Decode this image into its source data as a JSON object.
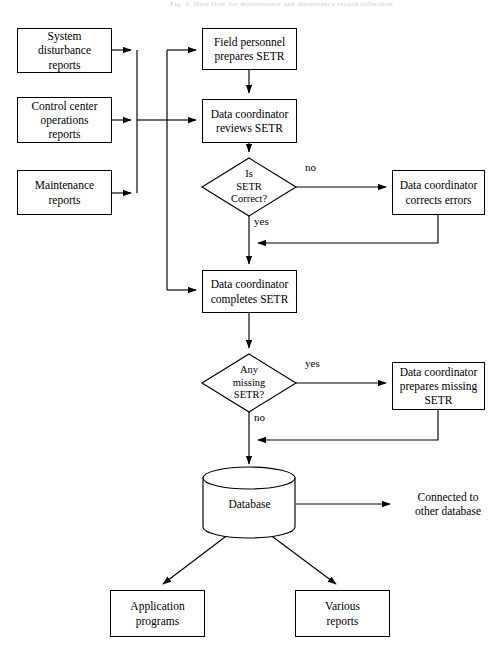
{
  "page": {
    "header_faint": "Fig. 4. Data flow for maintenance and disturbance record collection",
    "ink_color": "#000000",
    "background": "#ffffff"
  },
  "diagram": {
    "type": "flowchart",
    "inputs": [
      {
        "id": "system-disturbance-reports",
        "label": "System\ndisturbance\nreports",
        "lines": [
          "System",
          "disturbance",
          "reports"
        ],
        "shape": "rect",
        "x": 17,
        "y": 28,
        "w": 95,
        "h": 45
      },
      {
        "id": "control-center-operations-reports",
        "label": "Control center\noperations\nreports",
        "lines": [
          "Control center",
          "operations",
          "reports"
        ],
        "shape": "rect",
        "x": 17,
        "y": 97,
        "w": 95,
        "h": 46
      },
      {
        "id": "maintenance-reports",
        "label": "Maintenance\nreports",
        "lines": [
          "Maintenance",
          "reports"
        ],
        "shape": "rect",
        "x": 17,
        "y": 170,
        "w": 95,
        "h": 45
      }
    ],
    "process": [
      {
        "id": "field-personnel-prepares-setr",
        "label": "Field personnel\nprepares SETR",
        "lines": [
          "Field personnel",
          "prepares SETR"
        ],
        "shape": "rect",
        "x": 202,
        "y": 28,
        "w": 95,
        "h": 42
      },
      {
        "id": "data-coordinator-reviews-setr",
        "label": "Data coordinator\nreviews SETR",
        "lines": [
          "Data coordinator",
          "reviews SETR"
        ],
        "shape": "rect",
        "x": 202,
        "y": 99,
        "w": 95,
        "h": 44
      },
      {
        "id": "data-coordinator-completes-setr",
        "label": "Data coordinator\ncompletes SETR",
        "lines": [
          "Data coordinator",
          "completes SETR"
        ],
        "shape": "rect",
        "x": 202,
        "y": 270,
        "w": 95,
        "h": 43
      },
      {
        "id": "data-coordinator-corrects-errors",
        "label": "Data coordinator\ncorrects errors",
        "lines": [
          "Data coordinator",
          "corrects errors"
        ],
        "shape": "rect",
        "x": 392,
        "y": 170,
        "w": 93,
        "h": 45
      },
      {
        "id": "data-coordinator-prepares-missing-setr",
        "label": "Data coordinator\nprepares missing\nSETR",
        "lines": [
          "Data coordinator",
          "prepares missing",
          "SETR"
        ],
        "shape": "rect",
        "x": 392,
        "y": 362,
        "w": 93,
        "h": 48
      }
    ],
    "decisions": [
      {
        "id": "is-setr-correct",
        "lines": [
          "Is",
          "SETR",
          "Correct?"
        ],
        "shape": "diamond",
        "cx": 249,
        "cy": 187,
        "rx": 47,
        "ry": 29,
        "branches": [
          {
            "label": "no",
            "direction": "right",
            "target": "data-coordinator-corrects-errors",
            "lx": 305,
            "ly": 167
          },
          {
            "label": "yes",
            "direction": "down",
            "target": "data-coordinator-completes-setr",
            "lx": 254,
            "ly": 219
          }
        ]
      },
      {
        "id": "any-missing-setr",
        "lines": [
          "Any",
          "missing",
          "SETR?"
        ],
        "shape": "diamond",
        "cx": 249,
        "cy": 383,
        "rx": 47,
        "ry": 29,
        "branches": [
          {
            "label": "yes",
            "direction": "right",
            "target": "data-coordinator-prepares-missing-setr",
            "lx": 305,
            "ly": 363
          },
          {
            "label": "no",
            "direction": "down",
            "target": "database",
            "lx": 254,
            "ly": 415
          }
        ]
      }
    ],
    "store": {
      "id": "database",
      "label": "Database",
      "shape": "cylinder",
      "x": 203,
      "y": 468,
      "w": 93,
      "h": 68,
      "cx": 249,
      "cy": 504
    },
    "outputs": [
      {
        "id": "connected-to-other-database",
        "label": "Connected to\nother database",
        "lines": [
          "Connected to",
          "other database"
        ],
        "shape": "text",
        "x": 400,
        "y": 487,
        "w": 96,
        "h": 34
      },
      {
        "id": "application-programs",
        "label": "Application\nprograms",
        "lines": [
          "Application",
          "programs"
        ],
        "shape": "rect",
        "x": 110,
        "y": 590,
        "w": 95,
        "h": 47
      },
      {
        "id": "various-reports",
        "label": "Various\nreports",
        "lines": [
          "Various",
          "reports"
        ],
        "shape": "rect",
        "x": 295,
        "y": 590,
        "w": 95,
        "h": 47
      }
    ],
    "edges": [
      {
        "from": "system-disturbance-reports",
        "to": "input-bus",
        "label": ""
      },
      {
        "from": "control-center-operations-reports",
        "to": "input-bus",
        "label": ""
      },
      {
        "from": "maintenance-reports",
        "to": "input-bus",
        "label": ""
      },
      {
        "from": "input-bus",
        "to": "field-personnel-prepares-setr",
        "label": ""
      },
      {
        "from": "input-bus",
        "to": "data-coordinator-reviews-setr",
        "label": ""
      },
      {
        "from": "input-bus",
        "to": "data-coordinator-completes-setr",
        "label": ""
      },
      {
        "from": "field-personnel-prepares-setr",
        "to": "data-coordinator-reviews-setr",
        "label": ""
      },
      {
        "from": "data-coordinator-reviews-setr",
        "to": "is-setr-correct",
        "label": ""
      },
      {
        "from": "is-setr-correct",
        "to": "data-coordinator-corrects-errors",
        "label": "no"
      },
      {
        "from": "data-coordinator-corrects-errors",
        "to": "data-coordinator-completes-setr",
        "label": ""
      },
      {
        "from": "is-setr-correct",
        "to": "data-coordinator-completes-setr",
        "label": "yes"
      },
      {
        "from": "data-coordinator-completes-setr",
        "to": "any-missing-setr",
        "label": ""
      },
      {
        "from": "any-missing-setr",
        "to": "data-coordinator-prepares-missing-setr",
        "label": "yes"
      },
      {
        "from": "data-coordinator-prepares-missing-setr",
        "to": "database",
        "label": ""
      },
      {
        "from": "any-missing-setr",
        "to": "database",
        "label": "no"
      },
      {
        "from": "database",
        "to": "connected-to-other-database",
        "label": ""
      },
      {
        "from": "database",
        "to": "application-programs",
        "label": ""
      },
      {
        "from": "database",
        "to": "various-reports",
        "label": ""
      }
    ]
  }
}
